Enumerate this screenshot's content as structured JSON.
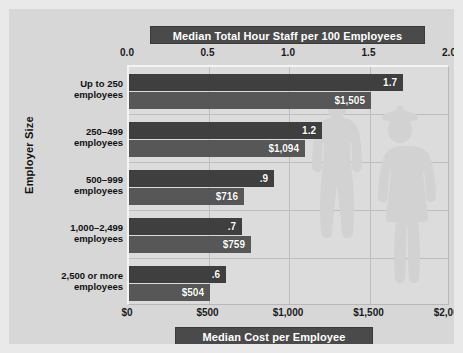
{
  "chart_data": {
    "type": "bar",
    "orientation": "horizontal",
    "title": "Median Total Hour Staff per 100 Employees",
    "bottom_title": "Median Cost per Employee",
    "ylabel": "Employer Size",
    "categories": [
      "Up to 250\nemployees",
      "250–499\nemployees",
      "500–999\nemployees",
      "1,000–2,499\nemployees",
      "2,500 or more\nemployees"
    ],
    "category_lines": [
      [
        "Up to 250",
        "employees"
      ],
      [
        "250–499",
        "employees"
      ],
      [
        "500–999",
        "employees"
      ],
      [
        "1,000–2,499",
        "employees"
      ],
      [
        "2,500 or more",
        "employees"
      ]
    ],
    "series": [
      {
        "name": "Median Total Hour Staff per 100 Employees",
        "axis": "top",
        "color": "#3f3f3f",
        "values": [
          1.7,
          1.2,
          0.9,
          0.7,
          0.6
        ],
        "labels": [
          "1.7",
          "1.2",
          ".9",
          ".7",
          ".6"
        ]
      },
      {
        "name": "Median Cost per Employee",
        "axis": "bottom",
        "color": "#575757",
        "values": [
          1505,
          1094,
          716,
          759,
          504
        ],
        "labels": [
          "$1,505",
          "$1,094",
          "$716",
          "$759",
          "$504"
        ]
      }
    ],
    "top_axis": {
      "label": "Median Total Hour Staff per 100 Employees",
      "min": 0.0,
      "max": 2.0,
      "ticks": [
        0.0,
        0.5,
        1.0,
        1.5,
        2.0
      ],
      "tick_labels": [
        "0.0",
        "0.5",
        "1.0",
        "1.5",
        "2.0"
      ]
    },
    "bottom_axis": {
      "label": "Median Cost per Employee",
      "min": 0,
      "max": 2000,
      "ticks": [
        0,
        500,
        1000,
        1500,
        2000
      ],
      "tick_labels": [
        "$0",
        "$500",
        "$1,000",
        "$1,500",
        "$2,000"
      ]
    },
    "grid": true,
    "legend": "none",
    "background_watermark": "two human silhouettes",
    "colors": {
      "page_background": "#d7d7d7",
      "plot_background": "#dcdcdc",
      "banner_background": "#4a4a4a",
      "banner_text": "#ffffff",
      "staff_bar": "#3f3f3f",
      "cost_bar": "#575757",
      "gridline": "#bdbdbd",
      "text": "#111111"
    }
  }
}
